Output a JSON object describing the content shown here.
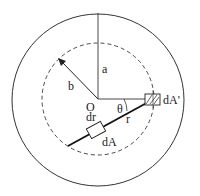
{
  "diagram": {
    "labels": {
      "center": "O",
      "outer_radius": "a",
      "inner_radius": "b",
      "angle": "θ",
      "distance": "r",
      "radial_element": "dr",
      "area_element": "dA",
      "area_element_prime": "dA'"
    },
    "colors": {
      "stroke": "#222222",
      "background": "#ffffff"
    }
  }
}
